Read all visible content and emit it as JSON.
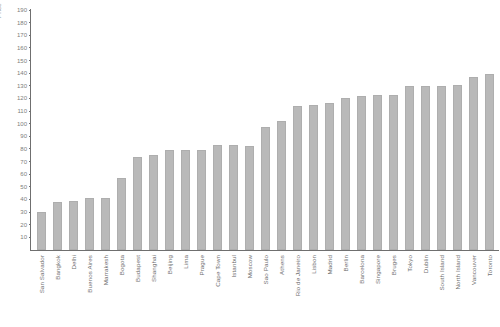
{
  "chart_data": {
    "type": "bar",
    "title": "",
    "xlabel": "",
    "ylabel": "Price",
    "ylim": [
      0,
      190
    ],
    "grid": false,
    "legend": false,
    "bar_color": "#b9b9b9",
    "axis_color": "#6f6f6f",
    "tick_label_color": "#7d7d7d",
    "yticks": [
      190,
      180,
      170,
      160,
      150,
      140,
      130,
      120,
      110,
      100,
      90,
      80,
      70,
      60,
      50,
      40,
      30,
      20,
      10
    ],
    "categories": [
      "San Salvador",
      "Bangkok",
      "Delhi",
      "Buenos Aires",
      "Marrakesh",
      "Bogota",
      "Budapest",
      "Shanghai",
      "Beijing",
      "Lima",
      "Prague",
      "Cape Town",
      "Istanbul",
      "Moscow",
      "Sao Paulo",
      "Athens",
      "Rio de Janeiro",
      "Lisbon",
      "Madrid",
      "Berlin",
      "Barcelona",
      "Singapore",
      "Bruges",
      "Tokyo",
      "Dublin",
      "South Island",
      "North Island",
      "Vancouver",
      "Toronto"
    ],
    "values": [
      30,
      38,
      39,
      41,
      41,
      57,
      74,
      75,
      79,
      79,
      79,
      83,
      83,
      82,
      97,
      102,
      114,
      115,
      116,
      120,
      122,
      123,
      123,
      130,
      130,
      130,
      131,
      137,
      139
    ]
  }
}
